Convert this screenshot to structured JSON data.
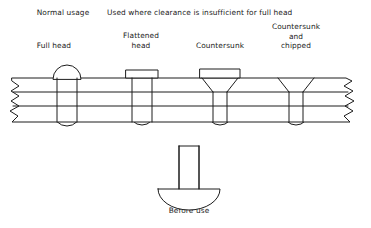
{
  "figure": {
    "type": "engineering-diagram",
    "headings": {
      "normal_usage": "Normal usage",
      "clearance": "Used where clearance is insufficient for full head"
    },
    "rivets": [
      {
        "id": "full-head",
        "label": "Full head",
        "center_x": 67,
        "head_style": "domed-round"
      },
      {
        "id": "flattened-head",
        "label": "Flattened\nhead",
        "center_x": 141,
        "head_style": "flat-rectangular-cap"
      },
      {
        "id": "countersunk",
        "label": "Countersunk",
        "center_x": 220,
        "head_style": "countersunk-proud"
      },
      {
        "id": "countersunk-chipped",
        "label": "Countersunk\nand\nchipped",
        "center_x": 296,
        "head_style": "countersunk-flush"
      }
    ],
    "before_use": {
      "label": "Before use",
      "center_x": 189,
      "description": "Plain shank rivet with preformed domed head"
    },
    "plate": {
      "top_y": 78,
      "bottom_y": 122,
      "mid_lines": [
        92,
        106
      ],
      "left_break": true,
      "right_break": true
    },
    "colors": {
      "line": "#1c1c1c",
      "background": "#ffffff",
      "text": "#1a1a1a"
    }
  }
}
